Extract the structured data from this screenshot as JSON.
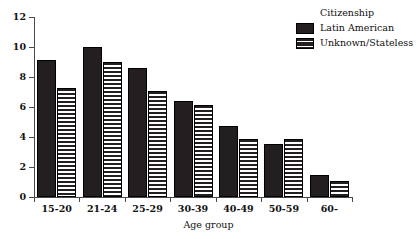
{
  "chart_data": {
    "type": "bar",
    "title": "",
    "xlabel": "Age group",
    "ylabel": "",
    "categories": [
      "15-20",
      "21-24",
      "25-29",
      "30-39",
      "40-49",
      "50-59",
      "60-"
    ],
    "series": [
      {
        "name": "Latin American",
        "fill": "solid",
        "color": "#231f20",
        "values": [
          9.15,
          10.0,
          8.6,
          6.4,
          4.75,
          3.55,
          1.5
        ]
      },
      {
        "name": "Unknown/Stateless",
        "fill": "horizontal-stripes",
        "color": "#231f20",
        "values": [
          7.3,
          9.0,
          7.1,
          6.15,
          3.85,
          3.9,
          1.05
        ]
      }
    ],
    "ylim": [
      0,
      12
    ],
    "yticks": [
      0,
      2,
      4,
      6,
      8,
      10,
      12
    ],
    "ytick_labels": [
      "0",
      "2",
      "4",
      "6",
      "8",
      "10",
      "12"
    ],
    "grid": false,
    "legend": {
      "title": "Citizenship",
      "position": "top-right",
      "entries": [
        {
          "label": "Latin American",
          "swatch": "solid"
        },
        {
          "label": "Unknown/Stateless",
          "swatch": "striped"
        }
      ]
    }
  }
}
